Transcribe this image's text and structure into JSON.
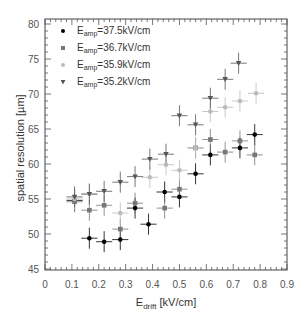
{
  "chart_data": {
    "type": "scatter",
    "title": "",
    "xlabel": "E_drift [kV/cm]",
    "xlabel_main": "E",
    "xlabel_sub": "drift",
    "xlabel_unit": " [kV/cm]",
    "ylabel": "spatial resolution [µm]",
    "xlim": [
      0,
      0.9
    ],
    "ylim": [
      45,
      80
    ],
    "xticks": [
      "0",
      "0.1",
      "0.2",
      "0.3",
      "0.4",
      "0.5",
      "0.6",
      "0.7",
      "0.8",
      "0.9"
    ],
    "yticks": [
      "45",
      "50",
      "55",
      "60",
      "65",
      "70",
      "75",
      "80"
    ],
    "grid": false,
    "legend_position": "upper-left",
    "series": [
      {
        "name": "E_amp=37.5kV/cm",
        "label_main": "E",
        "label_sub": "amp",
        "label_value": "=37.5kV/cm",
        "marker": "circle",
        "color": "#000000",
        "x": [
          0.11,
          0.165,
          0.22,
          0.28,
          0.335,
          0.385,
          0.445,
          0.5,
          0.56,
          0.615,
          0.725,
          0.78
        ],
        "y": [
          54.8,
          49.4,
          48.9,
          49.2,
          53.7,
          51.4,
          56.0,
          55.3,
          58.6,
          61.3,
          62.3,
          64.2
        ]
      },
      {
        "name": "E_amp=36.7kV/cm",
        "label_main": "E",
        "label_sub": "amp",
        "label_value": "=36.7kV/cm",
        "marker": "square",
        "color": "#777777",
        "x": [
          0.11,
          0.165,
          0.22,
          0.28,
          0.335,
          0.445,
          0.5,
          0.56,
          0.615,
          0.67,
          0.725,
          0.78
        ],
        "y": [
          54.6,
          53.4,
          54.1,
          50.7,
          54.4,
          53.7,
          56.4,
          62.3,
          63.5,
          61.7,
          63.3,
          61.3
        ]
      },
      {
        "name": "E_amp=35.9kV/cm",
        "label_main": "E",
        "label_sub": "amp",
        "label_value": "=35.9kV/cm",
        "marker": "circle",
        "color": "#bbbbbb",
        "x": [
          0.11,
          0.165,
          0.28,
          0.39,
          0.45,
          0.5,
          0.56,
          0.615,
          0.67,
          0.725,
          0.785
        ],
        "y": [
          55.0,
          55.7,
          53.0,
          58.1,
          59.9,
          59.1,
          62.3,
          67.5,
          68.1,
          69.0,
          70.1
        ]
      },
      {
        "name": "E_amp=35.2kV/cm",
        "label_main": "E",
        "label_sub": "amp",
        "label_value": "=35.2kV/cm",
        "marker": "triangle-down",
        "color": "#555555",
        "x": [
          0.11,
          0.165,
          0.22,
          0.28,
          0.335,
          0.39,
          0.45,
          0.5,
          0.56,
          0.615,
          0.67,
          0.72
        ],
        "y": [
          55.3,
          55.7,
          56.1,
          57.4,
          58.2,
          60.7,
          61.4,
          66.9,
          65.6,
          69.4,
          72.1,
          74.4
        ]
      }
    ],
    "error_bars": {
      "x_halfwidth": 0.03,
      "y_halfwidth": 1.5
    }
  }
}
